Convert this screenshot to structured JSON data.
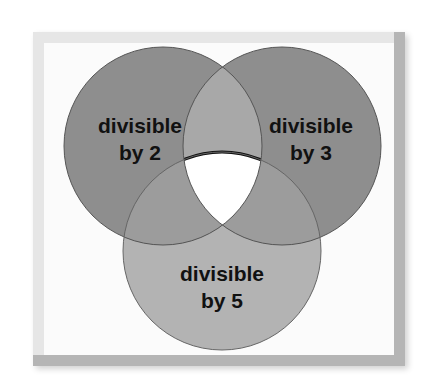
{
  "diagram": {
    "type": "venn",
    "sets": [
      {
        "id": "a",
        "label_line1": "divisible",
        "label_line2": "by 2",
        "color": "#8c8c8c"
      },
      {
        "id": "b",
        "label_line1": "divisible",
        "label_line2": "by 3",
        "color": "#8c8c8c"
      },
      {
        "id": "c",
        "label_line1": "divisible",
        "label_line2": "by 5",
        "color": "#b4b4b4"
      }
    ],
    "colors": {
      "pair_ab": "#a6a6a6",
      "pair_ac": "#9a9a9a",
      "pair_bc": "#9a9a9a",
      "center": "#ffffff",
      "outline": "#444444"
    }
  }
}
